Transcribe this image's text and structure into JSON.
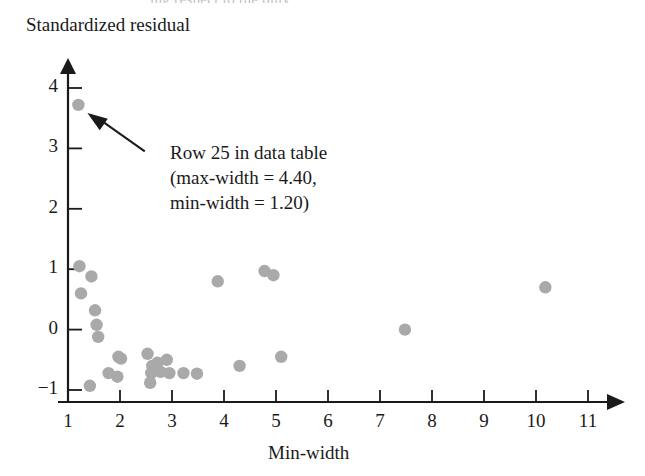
{
  "figure": {
    "partial_top_line": "ing respect to the only",
    "annotation_lines": [
      "Row 25 in data table",
      "(max-width = 4.40,",
      "min-width = 1.20)"
    ],
    "point_color": "#a9a9a9",
    "axis_color": "#1a1a1a"
  },
  "chart_data": {
    "type": "scatter",
    "title": "",
    "xlabel": "Min-width",
    "ylabel": "Standardized residual",
    "xlim": [
      0.6,
      11.6
    ],
    "ylim": [
      -1.25,
      4.35
    ],
    "xticks": [
      1,
      2,
      3,
      4,
      5,
      6,
      7,
      8,
      9,
      10,
      11
    ],
    "yticks": [
      -1,
      0,
      1,
      2,
      3,
      4
    ],
    "xticklabels": [
      "1",
      "2",
      "3",
      "4",
      "5",
      "6",
      "7",
      "8",
      "9",
      "10",
      "11"
    ],
    "yticklabels": [
      "−1",
      "0",
      "1",
      "2",
      "3",
      "4"
    ],
    "grid": false,
    "legend": null,
    "annotations": [
      {
        "text": "Row 25 in data table (max-width = 4.40, min-width = 1.20)",
        "points_to": [
          1.2,
          3.72
        ],
        "label_at": [
          2.9,
          3.05
        ]
      }
    ],
    "points": [
      [
        1.2,
        3.72
      ],
      [
        1.22,
        1.05
      ],
      [
        1.45,
        0.88
      ],
      [
        1.25,
        0.6
      ],
      [
        1.52,
        0.32
      ],
      [
        1.55,
        0.08
      ],
      [
        1.58,
        -0.12
      ],
      [
        1.42,
        -0.93
      ],
      [
        1.97,
        -0.45
      ],
      [
        2.02,
        -0.48
      ],
      [
        1.78,
        -0.72
      ],
      [
        1.95,
        -0.78
      ],
      [
        2.53,
        -0.4
      ],
      [
        2.62,
        -0.6
      ],
      [
        2.6,
        -0.72
      ],
      [
        2.58,
        -0.88
      ],
      [
        2.72,
        -0.55
      ],
      [
        2.78,
        -0.7
      ],
      [
        2.9,
        -0.5
      ],
      [
        2.95,
        -0.72
      ],
      [
        3.22,
        -0.72
      ],
      [
        3.48,
        -0.73
      ],
      [
        3.88,
        0.8
      ],
      [
        4.3,
        -0.6
      ],
      [
        4.78,
        0.97
      ],
      [
        4.95,
        0.9
      ],
      [
        5.1,
        -0.45
      ],
      [
        7.48,
        0.0
      ],
      [
        10.18,
        0.7
      ]
    ]
  }
}
